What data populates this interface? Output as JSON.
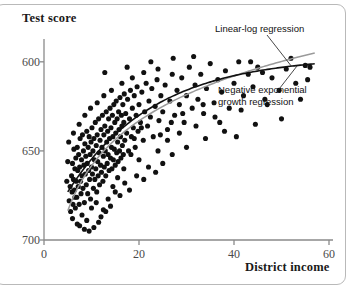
{
  "chart_data": {
    "type": "scatter",
    "title": "",
    "xlabel": "District income",
    "ylabel": "Test score",
    "xlim": [
      0,
      60
    ],
    "ylim": [
      600,
      710
    ],
    "xticks": [
      0,
      20,
      40,
      60
    ],
    "yticks": [
      600,
      650,
      700
    ],
    "grid": false,
    "legend_position": "in-plot-annotations",
    "annotations": [
      {
        "id": "linear-log",
        "text": "Linear-log regression",
        "color": "#8c8c8c"
      },
      {
        "id": "negative-exponential",
        "text": "Negative exponential",
        "text2": "growth regression",
        "color": "#111111"
      }
    ],
    "series": [
      {
        "name": "districts",
        "type": "scatter",
        "marker": "filled-circle",
        "color": "#111111",
        "points": [
          [
            5.3,
            622
          ],
          [
            5.5,
            630
          ],
          [
            5.6,
            616
          ],
          [
            5.8,
            636
          ],
          [
            5.9,
            627
          ],
          [
            6.0,
            643
          ],
          [
            6.1,
            620
          ],
          [
            6.2,
            634
          ],
          [
            6.3,
            651
          ],
          [
            6.4,
            628
          ],
          [
            6.5,
            640
          ],
          [
            6.6,
            618
          ],
          [
            6.7,
            646
          ],
          [
            6.8,
            633
          ],
          [
            6.9,
            624
          ],
          [
            7.0,
            652
          ],
          [
            7.1,
            639
          ],
          [
            7.2,
            630
          ],
          [
            7.3,
            648
          ],
          [
            7.4,
            620
          ],
          [
            7.5,
            641
          ],
          [
            7.6,
            657
          ],
          [
            7.7,
            633
          ],
          [
            7.8,
            626
          ],
          [
            7.9,
            645
          ],
          [
            8.0,
            636
          ],
          [
            8.1,
            659
          ],
          [
            8.2,
            629
          ],
          [
            8.3,
            650
          ],
          [
            8.4,
            642
          ],
          [
            8.5,
            621
          ],
          [
            8.6,
            654
          ],
          [
            8.7,
            637
          ],
          [
            8.8,
            647
          ],
          [
            8.9,
            631
          ],
          [
            9.0,
            661
          ],
          [
            9.1,
            643
          ],
          [
            9.2,
            626
          ],
          [
            9.3,
            652
          ],
          [
            9.4,
            639
          ],
          [
            9.5,
            658
          ],
          [
            9.6,
            634
          ],
          [
            9.7,
            648
          ],
          [
            9.8,
            623
          ],
          [
            9.9,
            655
          ],
          [
            10.0,
            641
          ],
          [
            10.1,
            663
          ],
          [
            10.2,
            637
          ],
          [
            10.3,
            650
          ],
          [
            10.4,
            629
          ],
          [
            10.5,
            657
          ],
          [
            10.6,
            645
          ],
          [
            10.7,
            634
          ],
          [
            10.8,
            666
          ],
          [
            10.9,
            640
          ],
          [
            11.0,
            653
          ],
          [
            11.1,
            627
          ],
          [
            11.2,
            659
          ],
          [
            11.3,
            644
          ],
          [
            11.4,
            636
          ],
          [
            11.5,
            668
          ],
          [
            11.6,
            649
          ],
          [
            11.7,
            631
          ],
          [
            11.8,
            656
          ],
          [
            11.9,
            642
          ],
          [
            12.0,
            662
          ],
          [
            12.1,
            638
          ],
          [
            12.2,
            652
          ],
          [
            12.3,
            670
          ],
          [
            12.4,
            633
          ],
          [
            12.5,
            647
          ],
          [
            12.6,
            659
          ],
          [
            12.7,
            641
          ],
          [
            12.8,
            664
          ],
          [
            12.9,
            650
          ],
          [
            13.0,
            636
          ],
          [
            13.1,
            672
          ],
          [
            13.2,
            655
          ],
          [
            13.3,
            643
          ],
          [
            13.4,
            661
          ],
          [
            13.5,
            648
          ],
          [
            13.6,
            668
          ],
          [
            13.7,
            639
          ],
          [
            13.8,
            657
          ],
          [
            13.9,
            674
          ],
          [
            14.0,
            646
          ],
          [
            14.1,
            663
          ],
          [
            14.2,
            652
          ],
          [
            14.3,
            640
          ],
          [
            14.4,
            670
          ],
          [
            14.5,
            658
          ],
          [
            14.6,
            645
          ],
          [
            14.7,
            676
          ],
          [
            14.8,
            651
          ],
          [
            14.9,
            666
          ],
          [
            15.0,
            642
          ],
          [
            15.1,
            660
          ],
          [
            15.2,
            678
          ],
          [
            15.3,
            649
          ],
          [
            15.4,
            668
          ],
          [
            15.5,
            655
          ],
          [
            15.6,
            644
          ],
          [
            15.7,
            672
          ],
          [
            15.8,
            662
          ],
          [
            15.9,
            650
          ],
          [
            16.0,
            680
          ],
          [
            16.1,
            658
          ],
          [
            16.2,
            646
          ],
          [
            16.3,
            670
          ],
          [
            16.4,
            664
          ],
          [
            16.5,
            653
          ],
          [
            16.6,
            676
          ],
          [
            16.7,
            648
          ],
          [
            16.8,
            666
          ],
          [
            16.9,
            682
          ],
          [
            17.0,
            656
          ],
          [
            17.2,
            671
          ],
          [
            17.4,
            660
          ],
          [
            17.6,
            679
          ],
          [
            17.8,
            650
          ],
          [
            18.0,
            668
          ],
          [
            18.2,
            684
          ],
          [
            18.4,
            658
          ],
          [
            18.6,
            674
          ],
          [
            18.8,
            663
          ],
          [
            19.0,
            681
          ],
          [
            19.2,
            652
          ],
          [
            19.4,
            670
          ],
          [
            19.6,
            686
          ],
          [
            19.8,
            661
          ],
          [
            20.0,
            676
          ],
          [
            20.3,
            666
          ],
          [
            20.6,
            683
          ],
          [
            20.9,
            656
          ],
          [
            21.2,
            672
          ],
          [
            21.5,
            688
          ],
          [
            21.8,
            664
          ],
          [
            22.1,
            678
          ],
          [
            22.4,
            669
          ],
          [
            22.7,
            685
          ],
          [
            23.0,
            658
          ],
          [
            23.4,
            675
          ],
          [
            23.8,
            690
          ],
          [
            24.2,
            667
          ],
          [
            24.6,
            681
          ],
          [
            25.0,
            672
          ],
          [
            25.5,
            687
          ],
          [
            26.0,
            662
          ],
          [
            26.5,
            678
          ],
          [
            27.0,
            693
          ],
          [
            27.5,
            670
          ],
          [
            28.0,
            684
          ],
          [
            28.5,
            676
          ],
          [
            29.0,
            691
          ],
          [
            29.5,
            666
          ],
          [
            30.0,
            681
          ],
          [
            30.6,
            697
          ],
          [
            31.2,
            674
          ],
          [
            31.8,
            687
          ],
          [
            32.4,
            679
          ],
          [
            33.0,
            693
          ],
          [
            33.6,
            671
          ],
          [
            34.2,
            685
          ],
          [
            35.0,
            699
          ],
          [
            35.8,
            677
          ],
          [
            36.6,
            690
          ],
          [
            37.4,
            683
          ],
          [
            38.2,
            695
          ],
          [
            39.0,
            674
          ],
          [
            40.0,
            688
          ],
          [
            41.0,
            700
          ],
          [
            42.0,
            681
          ],
          [
            43.0,
            693
          ],
          [
            44.0,
            686
          ],
          [
            45.0,
            697
          ],
          [
            46.5,
            679
          ],
          [
            48.0,
            691
          ],
          [
            49.5,
            684
          ],
          [
            51.0,
            696
          ],
          [
            53.0,
            688
          ],
          [
            55.0,
            698
          ],
          [
            6.0,
            612
          ],
          [
            7.5,
            608
          ],
          [
            9.0,
            611
          ],
          [
            10.5,
            607
          ],
          [
            8.0,
            614
          ],
          [
            11.5,
            610
          ],
          [
            13.0,
            616
          ],
          [
            9.5,
            605
          ],
          [
            12.0,
            613
          ],
          [
            14.0,
            619
          ],
          [
            10.0,
            618
          ],
          [
            7.0,
            609
          ],
          [
            8.5,
            606
          ],
          [
            11.0,
            621
          ],
          [
            12.5,
            617
          ],
          [
            6.5,
            624
          ],
          [
            13.5,
            623
          ],
          [
            15.0,
            627
          ],
          [
            16.0,
            625
          ],
          [
            14.5,
            630
          ],
          [
            17.0,
            632
          ],
          [
            18.0,
            628
          ],
          [
            19.5,
            636
          ],
          [
            21.0,
            634
          ],
          [
            22.0,
            641
          ],
          [
            23.5,
            638
          ],
          [
            20.0,
            645
          ],
          [
            24.0,
            650
          ],
          [
            25.0,
            643
          ],
          [
            26.0,
            656
          ],
          [
            27.0,
            648
          ],
          [
            28.5,
            660
          ],
          [
            30.0,
            652
          ],
          [
            32.0,
            664
          ],
          [
            34.0,
            657
          ],
          [
            36.0,
            669
          ],
          [
            38.0,
            661
          ],
          [
            41.5,
            673
          ],
          [
            44.5,
            665
          ],
          [
            47.0,
            676
          ],
          [
            50.0,
            668
          ],
          [
            54.0,
            679
          ],
          [
            4.8,
            633
          ],
          [
            5.0,
            644
          ],
          [
            5.2,
            655
          ],
          [
            6.2,
            660
          ],
          [
            7.4,
            665
          ],
          [
            8.6,
            670
          ],
          [
            9.8,
            674
          ],
          [
            11.2,
            677
          ],
          [
            12.6,
            681
          ],
          [
            14.2,
            684
          ],
          [
            16.4,
            688
          ],
          [
            18.6,
            691
          ],
          [
            21.0,
            694
          ],
          [
            24.0,
            696
          ],
          [
            12.8,
            694
          ],
          [
            17.5,
            697
          ],
          [
            22.5,
            700
          ],
          [
            27.2,
            702
          ],
          [
            31.5,
            703
          ],
          [
            19.0,
            657
          ],
          [
            20.5,
            663
          ],
          [
            18.3,
            648
          ],
          [
            16.8,
            640
          ],
          [
            15.5,
            635
          ],
          [
            24.5,
            659
          ],
          [
            26.8,
            666
          ],
          [
            29.2,
            671
          ],
          [
            33.5,
            676
          ],
          [
            37.0,
            666
          ],
          [
            40.5,
            658
          ],
          [
            43.5,
            700
          ],
          [
            46.0,
            694
          ],
          [
            52.0,
            702
          ],
          [
            56.0,
            697
          ],
          [
            55.5,
            690
          ]
        ]
      },
      {
        "name": "Linear-log regression",
        "type": "line",
        "color": "#9a9a9a",
        "curve": "a+b*ln(x)",
        "params": {
          "a": 557.8,
          "b": 36.4
        },
        "x_range": [
          5.0,
          57.0
        ]
      },
      {
        "name": "Negative exponential growth regression",
        "type": "line",
        "color": "#111111",
        "curve": "a-b*exp(-c*x)",
        "params": {
          "a": 703.2,
          "b": 100.5,
          "c": 0.0553
        },
        "x_range": [
          5.0,
          57.0
        ]
      }
    ]
  },
  "axis": {
    "y_title": "Test score",
    "x_title": "District income",
    "y_tick_labels": [
      "700",
      "650",
      "600"
    ],
    "x_tick_labels": [
      "0",
      "20",
      "40",
      "60"
    ]
  },
  "annotations": {
    "linear_log": "Linear-log regression",
    "neg_exp_line1": "Negative exponential",
    "neg_exp_line2": "growth regression"
  },
  "colors": {
    "axis": "#8a8a8a",
    "point": "#111111",
    "linear_log_curve": "#9a9a9a",
    "neg_exp_curve": "#111111",
    "frame": "#b9b9b9"
  }
}
